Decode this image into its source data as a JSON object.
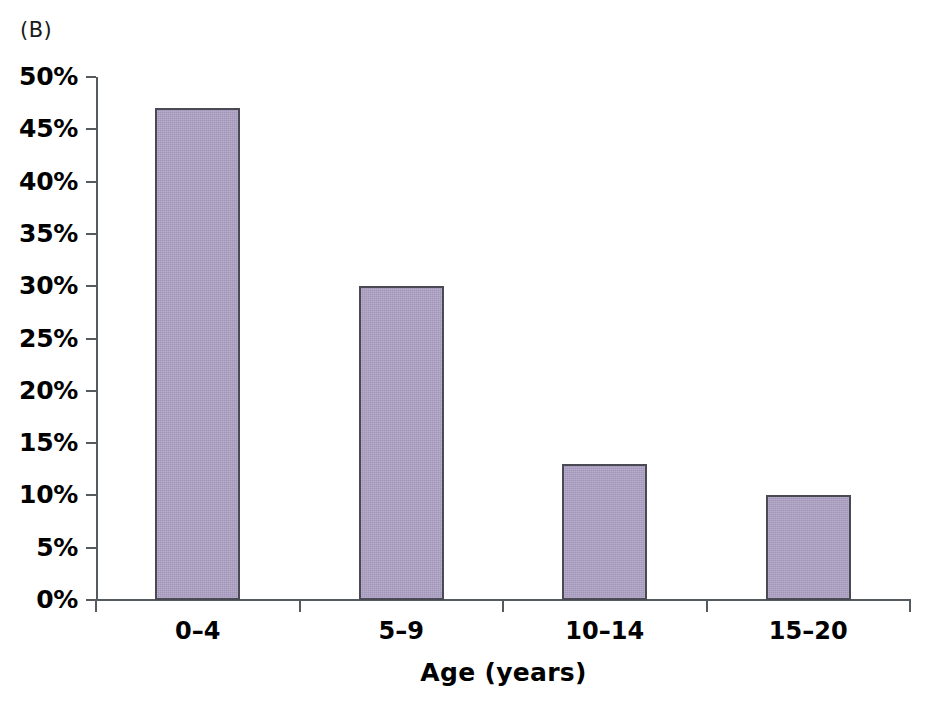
{
  "panel": {
    "label": "(B)"
  },
  "chart_data": {
    "type": "bar",
    "title": "",
    "subtitle": "",
    "panel_label": "(B)",
    "categories": [
      "0–4",
      "5–9",
      "10–14",
      "15–20"
    ],
    "values": [
      47,
      30,
      13,
      10
    ],
    "value_labels": [
      "47%",
      "30%",
      "13%",
      "10%"
    ],
    "xlabel": "Age (years)",
    "ylabel": "",
    "ylim": [
      0,
      50
    ],
    "ytick_step": 5,
    "ytick_labels": [
      "0%",
      "5%",
      "10%",
      "15%",
      "20%",
      "25%",
      "30%",
      "35%",
      "40%",
      "45%",
      "50%"
    ],
    "ytick_values": [
      0,
      5,
      10,
      15,
      20,
      25,
      30,
      35,
      40,
      45,
      50
    ],
    "grid": false,
    "legend": null,
    "legend_position": "none",
    "bar_fill_color": "#a89cc0",
    "bar_border_color": "#4a4a55",
    "axis_color": "#555a5e",
    "text_color": "#000000",
    "background_color": "#ffffff"
  }
}
